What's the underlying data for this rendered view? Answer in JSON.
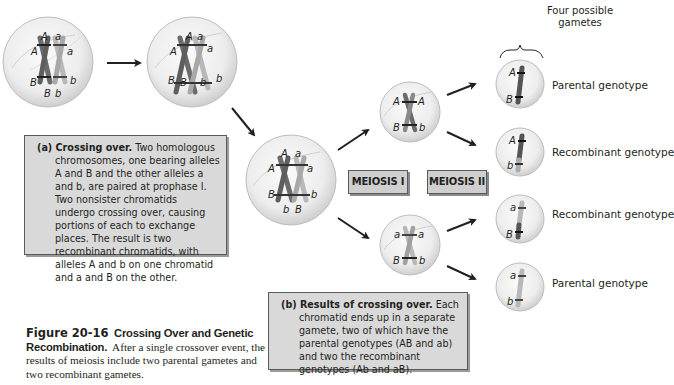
{
  "figure": {
    "number": "Figure 20-16",
    "title": "Crossing Over and Genetic Recombination.",
    "caption": "After a single crossover event, the results of meiosis include two parental gametes and two recombinant gametes."
  },
  "panel_a": {
    "heading": "(a) Crossing over.",
    "text": "Two homologous chromosomes, one bearing alleles A and B and the other alleles a and b, are paired at prophase I. Two nonsister chromatids undergo crossing over, causing portions of each to exchange places. The result is two recombinant chromatids, with alleles A and b on one chromatid and a and B on the other."
  },
  "panel_b": {
    "heading": "(b) Results of crossing over.",
    "text": "Each chromatid ends up in a separate gamete, two of which have the parental genotypes (AB and ab) and two the recombinant genotypes (Ab and aB)."
  },
  "stage_labels": {
    "meiosis1": "MEIOSIS I",
    "meiosis2": "MEIOSIS II"
  },
  "gametes_header": "Four possible gametes",
  "gametes": [
    {
      "top": "A",
      "bottom": "B",
      "label": "Parental genotype"
    },
    {
      "top": "A",
      "bottom": "b",
      "label": "Recombinant genotype"
    },
    {
      "top": "a",
      "bottom": "B",
      "label": "Recombinant genotype"
    },
    {
      "top": "a",
      "bottom": "b",
      "label": "Parental genotype"
    }
  ],
  "cells": {
    "cell1": {
      "top": [
        "A",
        "a",
        "A",
        "a"
      ],
      "bottom": [
        "B",
        "B",
        "b",
        "b"
      ]
    },
    "cell2": {
      "top": [
        "A",
        "a",
        "A",
        "a"
      ],
      "bottom": [
        "B",
        "B",
        "b",
        "b"
      ]
    },
    "cell3": {
      "top": [
        "A",
        "a",
        "A",
        "a"
      ],
      "bottom": [
        "B",
        "b",
        "B",
        "b"
      ]
    },
    "meiosis1_top": {
      "top": [
        "A",
        "A"
      ],
      "bottom": [
        "B",
        "b"
      ]
    },
    "meiosis1_bottom": {
      "top": [
        "a",
        "a"
      ],
      "bottom": [
        "B",
        "b"
      ]
    }
  },
  "colors": {
    "chrom_dark": "#6b6b6b",
    "chrom_light": "#b3b3b3",
    "box_fill": "#d9d9d9",
    "cell_fill": "#ececec"
  }
}
